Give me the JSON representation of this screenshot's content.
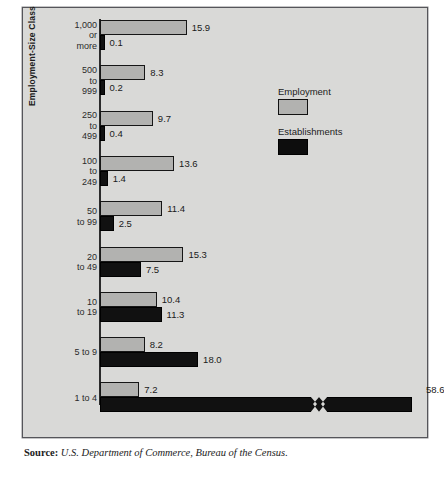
{
  "chart_data": {
    "type": "bar",
    "orientation": "horizontal",
    "title": "",
    "xlabel": "",
    "ylabel": "Employment-Size Class",
    "grid": false,
    "xlim": [
      0,
      20
    ],
    "value_unit": "percent",
    "axis_break": {
      "present": true,
      "on_series": "Establishments",
      "on_category": "1 to 4",
      "note": "bar truncated with zig-zag break; true value 58.6"
    },
    "categories": [
      "1,000\nor\nmore",
      "500\nto\n999",
      "250\nto\n499",
      "100\nto\n249",
      "50\nto 99",
      "20\nto 49",
      "10\nto 19",
      "5 to 9",
      "1 to 4"
    ],
    "series": [
      {
        "name": "Employment",
        "color": "#b2b2b0",
        "values": [
          15.9,
          8.3,
          9.7,
          13.6,
          11.4,
          15.3,
          10.4,
          8.2,
          7.2
        ],
        "labels": [
          "15.9",
          "8.3",
          "9.7",
          "13.6",
          "11.4",
          "15.3",
          "10.4",
          "8.2",
          "7.2"
        ]
      },
      {
        "name": "Establishments",
        "color": "#111111",
        "values": [
          0.1,
          0.2,
          0.4,
          1.4,
          2.5,
          7.5,
          11.3,
          18.0,
          58.6
        ],
        "labels": [
          "0.1",
          "0.2",
          "0.4",
          "1.4",
          "2.5",
          "7.5",
          "11.3",
          "18.0",
          "58.6"
        ]
      }
    ],
    "legend": {
      "position": "inside-right-top",
      "entries": [
        {
          "label": "Employment",
          "swatch": "gray-filled-black-outline"
        },
        {
          "label": "Establishments",
          "swatch": "black-filled"
        }
      ]
    }
  },
  "legend": {
    "employment_label": "Employment",
    "establishments_label": "Establishments"
  },
  "axis": {
    "y_title": "Employment-Size Class"
  },
  "source": {
    "lead": "Source:",
    "citation": "U.S. Department of Commerce, Bureau of the Census."
  }
}
